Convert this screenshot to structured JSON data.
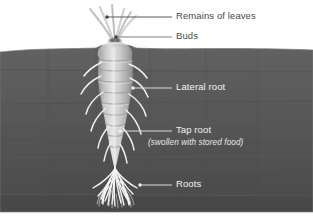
{
  "figure": {
    "kind": "botanical-diagram",
    "subject": "tap root",
    "canvas": {
      "width": 313,
      "height": 222
    },
    "colors": {
      "background": "#ffffff",
      "soil": "#5b5b5b",
      "soil_dark": "#4e4e4e",
      "root_body": "#c9c9c9",
      "root_highlight": "#e6e6e6",
      "root_shadow": "#9a9a9a",
      "fibrous_roots": "#f0f0f0",
      "leaf_stalk": "#d0d0d0",
      "label_dark": "#4a4a4a",
      "label_light": "#f2f2f2",
      "leader_dark": "#5a5a5a",
      "leader_light": "#e0e0e0"
    }
  },
  "labels": [
    {
      "id": "remains-of-leaves",
      "text": "Remains of leaves",
      "tone": "dark",
      "text_x": 176,
      "text_y": 13,
      "leader": {
        "x1": 107,
        "y1": 17,
        "x2": 172,
        "y2": 17
      },
      "dot": {
        "cx": 107,
        "cy": 17,
        "r": 1.7
      }
    },
    {
      "id": "buds",
      "text": "Buds",
      "tone": "dark",
      "text_x": 176,
      "text_y": 33,
      "leader": {
        "x1": 116,
        "y1": 37,
        "x2": 172,
        "y2": 37
      },
      "dot": {
        "cx": 116,
        "cy": 37,
        "r": 1.7
      }
    },
    {
      "id": "lateral-root",
      "text": "Lateral root",
      "tone": "light",
      "text_x": 176,
      "text_y": 84,
      "leader": {
        "x1": 133,
        "y1": 88,
        "x2": 172,
        "y2": 88
      },
      "dot": {
        "cx": 133,
        "cy": 88,
        "r": 1.7
      }
    },
    {
      "id": "tap-root",
      "text": "Tap root",
      "tone": "light",
      "text_x": 176,
      "text_y": 127,
      "leader": {
        "x1": 120,
        "y1": 131,
        "x2": 172,
        "y2": 131
      },
      "dot": {
        "cx": 120,
        "cy": 131,
        "r": 1.7
      }
    },
    {
      "id": "roots",
      "text": "Roots",
      "tone": "light",
      "text_x": 176,
      "text_y": 181,
      "leader": {
        "x1": 140,
        "y1": 185,
        "x2": 172,
        "y2": 185
      },
      "dot": {
        "cx": 140,
        "cy": 185,
        "r": 1.7
      }
    }
  ],
  "tap_root_subtitle": {
    "id": "tap-root-subtitle",
    "text": "(swollen with stored food)",
    "text_x": 148,
    "text_y": 139
  },
  "geometry": {
    "soil_top_y": 46,
    "soil_bottom_y": 212,
    "soil_surface_path": "M0,52 C40,48 70,49 96,48 C106,42 124,42 136,48 C172,50 232,47 313,50 L313,212 L0,212 Z",
    "root_axis_x": 115,
    "root_top_y": 40,
    "root_tip_y": 170,
    "root_body_path": "M100,52 C98,62 97,78 100,94 C103,112 107,130 110,148 C112,158 114,166 115,171 C116,166 118,158 120,148 C124,130 128,112 131,94 C134,78 133,62 131,52 C126,44 105,44 100,52 Z",
    "leaf_stalks": [
      "M112,40 C107,30 99,20 90,9",
      "M113,40 C110,30 105,19 100,7",
      "M115,40 C114,29 113,18 112,5",
      "M116,40 C118,30 121,20 124,9",
      "M117,40 C120,30 125,21 131,12",
      "M118,40 C122,31 128,23 136,16"
    ],
    "lateral_roots": [
      "M102,62 C94,66 88,70 84,76",
      "M129,64 C137,67 143,72 147,78",
      "M101,76 C92,80 85,86 81,94",
      "M130,78 C139,82 145,89 148,97",
      "M103,92 C94,98 88,106 86,114",
      "M129,94 C138,100 144,108 146,116",
      "M106,108 C98,115 93,123 91,131",
      "M126,110 C134,117 139,126 141,134",
      "M109,126 C103,133 99,141 98,148",
      "M123,128 C129,135 133,143 134,150",
      "M111,142 C107,149 105,155 104,161",
      "M120,144 C124,150 126,157 127,163"
    ],
    "fibrous_roots": [
      "M115,168 C112,178 106,188 98,196",
      "M115,168 C113,179 110,190 105,201",
      "M115,168 C114,180 113,192 112,204",
      "M115,168 C116,180 118,192 121,203",
      "M115,168 C117,179 121,189 127,199",
      "M115,168 C119,177 125,186 133,194",
      "M115,169 C110,176 102,183 93,188",
      "M115,169 C120,176 128,183 137,188",
      "M113,174 C108,182 104,190 101,199",
      "M118,175 C123,183 126,191 128,200",
      "M111,180 C106,187 103,195 102,203",
      "M120,181 C125,188 128,196 130,204",
      "M109,186 C105,192 103,198 103,204",
      "M122,187 C126,193 128,199 129,205",
      "M115,172 C114,184 114,196 115,206",
      "M116,176 C119,186 122,195 124,205",
      "M114,176 C111,186 109,195 108,205"
    ]
  }
}
